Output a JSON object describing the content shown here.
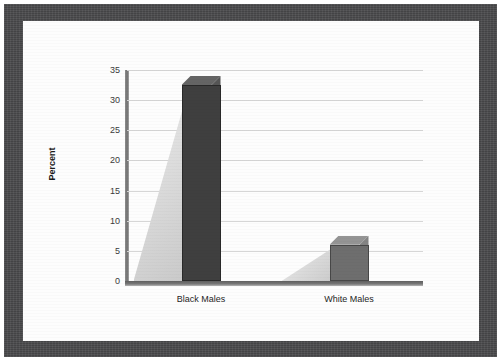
{
  "document": {
    "frame_color": "#4a4a4c",
    "page_color": "#fdfdfd"
  },
  "chart_data": {
    "type": "bar",
    "title": "",
    "subtitle": "",
    "xlabel": "",
    "ylabel": "Percent",
    "categories": [
      "Black Males",
      "White Males"
    ],
    "values": [
      32.5,
      6
    ],
    "series": [
      {
        "name": "Percent",
        "values": [
          32.5,
          6
        ]
      }
    ],
    "ylim": [
      0,
      35
    ],
    "yticks": [
      0,
      5,
      10,
      15,
      20,
      25,
      30,
      35
    ],
    "ytick_labels": [
      "0",
      "5",
      "10",
      "15",
      "20",
      "25",
      "30",
      "35"
    ],
    "grid": true,
    "legend": false,
    "legend_position": "none",
    "style": "3d-column",
    "bar_colors": [
      "#3f3f3f",
      "#6e6e6e"
    ],
    "shadow_color": "#dcdcdc",
    "gridline_color": "#d6d6d6",
    "axis_color": "#6f6f6f"
  }
}
